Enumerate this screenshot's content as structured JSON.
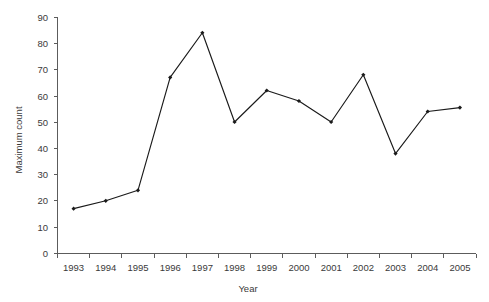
{
  "chart_data": {
    "type": "line",
    "title": "",
    "xlabel": "Year",
    "ylabel": "Maximum count",
    "categories": [
      "1993",
      "1994",
      "1995",
      "1996",
      "1997",
      "1998",
      "1999",
      "2000",
      "2001",
      "2002",
      "2003",
      "2004",
      "2005"
    ],
    "values": [
      17,
      20,
      24,
      67,
      84,
      50,
      62,
      58,
      50,
      68,
      38,
      54,
      55.5
    ],
    "series": [
      {
        "name": "Maximum count",
        "values": [
          17,
          20,
          24,
          67,
          84,
          50,
          62,
          58,
          50,
          68,
          38,
          54,
          55.5
        ]
      }
    ],
    "ylim": [
      0,
      90
    ],
    "yticks": [
      0,
      10,
      20,
      30,
      40,
      50,
      60,
      70,
      80,
      90
    ],
    "ytick_labels": [
      "0",
      "10",
      "20",
      "30",
      "40",
      "50",
      "60",
      "70",
      "80",
      "90"
    ],
    "xtick_labels": [
      "1993",
      "1994",
      "1995",
      "1996",
      "1997",
      "1998",
      "1999",
      "2000",
      "2001",
      "2002",
      "2003",
      "2004",
      "2005"
    ],
    "grid": false,
    "legend": "none",
    "marker": "filled-diamond",
    "line_color": "#1a1a1a",
    "axis_color": "#5c5c5c",
    "text_color": "#3a3a3a",
    "background": "#ffffff"
  }
}
